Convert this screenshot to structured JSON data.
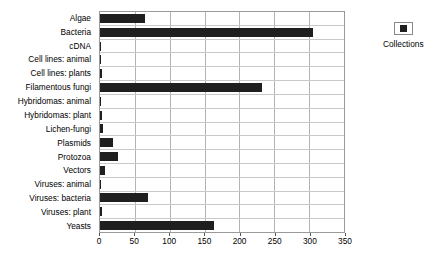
{
  "chart_data": {
    "type": "bar",
    "orientation": "horizontal",
    "title": "",
    "xlabel": "",
    "ylabel": "",
    "xlim": [
      0,
      350
    ],
    "ylim": null,
    "grid": true,
    "legend_position": "right",
    "series": [
      {
        "name": "Collections",
        "color": "#1f1f1f",
        "values": [
          64,
          305,
          2,
          2,
          3,
          233,
          2,
          3,
          4,
          18,
          26,
          7,
          2,
          69,
          3,
          163
        ]
      }
    ],
    "categories": [
      "Algae",
      "Bacteria",
      "cDNA",
      "Cell lines: animal",
      "Cell lines: plants",
      "Filamentous fungi",
      "Hybridomas: animal",
      "Hybridomas: plant",
      "Lichen-fungi",
      "Plasmids",
      "Protozoa",
      "Vectors",
      "Viruses: animal",
      "Viruses: bacteria",
      "Viruses: plant",
      "Yeasts"
    ],
    "xticks": [
      0,
      50,
      100,
      150,
      200,
      250,
      300,
      350
    ],
    "xticklabels": [
      "0",
      "50",
      "100",
      "150",
      "200",
      "250",
      "300",
      "350"
    ]
  },
  "legend": {
    "entries": [
      {
        "label": "Collections",
        "swatch_name": "legend-swatch-collections"
      }
    ]
  }
}
